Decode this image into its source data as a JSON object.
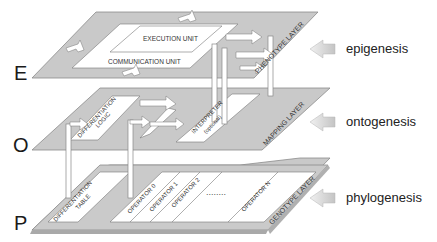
{
  "layers": [
    {
      "letter": "E",
      "name": "PHENOTYPE LAYER",
      "process": "epigenesis",
      "units": [
        "EXECUTION UNIT",
        "COMMUNICATION UNIT"
      ]
    },
    {
      "letter": "O",
      "name": "MAPPING LAYER",
      "process": "ontogenesis",
      "units": [
        "DIFFERENTIATION",
        "LOGIC",
        "INTERPRETER",
        "(optional)"
      ]
    },
    {
      "letter": "P",
      "name": "GENOTYPE LAYER",
      "process": "phylogenesis",
      "units": [
        "DIFFERENTIATION",
        "TABLE",
        "OPERATOR 0",
        "OPERATOR 1",
        "OPERATOR 2",
        "OPERATOR N"
      ],
      "ellipsis": "........"
    }
  ],
  "colors": {
    "plane": "#c8c8c8",
    "plane_edge": "#8a8a8a",
    "unit": "#ffffff",
    "arrow": "#d0d0d0",
    "text": "#333333"
  }
}
